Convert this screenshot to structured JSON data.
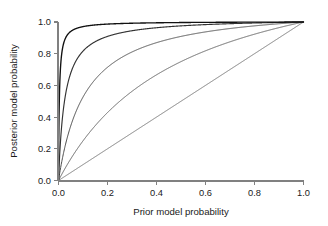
{
  "chart_data": {
    "type": "line",
    "title": "",
    "xlabel": "Prior model probability",
    "ylabel": "Posterior model probability",
    "xlim": [
      0.0,
      1.0
    ],
    "ylim": [
      0.0,
      1.0
    ],
    "grid": false,
    "legend": "none",
    "xticks": [
      "0.0",
      "0.2",
      "0.4",
      "0.6",
      "0.8",
      "1.0"
    ],
    "xtick_values": [
      0.0,
      0.2,
      0.4,
      0.6,
      0.8,
      1.0
    ],
    "yticks": [
      "0.0",
      "0.2",
      "0.4",
      "0.6",
      "0.8",
      "1.0"
    ],
    "ytick_values": [
      0.0,
      0.2,
      0.4,
      0.6,
      0.8,
      1.0
    ],
    "x": [
      0.0,
      0.01,
      0.02,
      0.03,
      0.05,
      0.075,
      0.1,
      0.15,
      0.2,
      0.25,
      0.3,
      0.35,
      0.4,
      0.5,
      0.6,
      0.7,
      0.8,
      0.9,
      0.95,
      1.0
    ],
    "series": [
      {
        "name": "Bayes factor 1",
        "label": "BF = 1",
        "bayes_factor": 1,
        "color": "#6b6b6b",
        "linewidth": 0.9,
        "values": [
          0.0,
          0.01,
          0.02,
          0.03,
          0.05,
          0.075,
          0.1,
          0.15,
          0.2,
          0.25,
          0.3,
          0.35,
          0.4,
          0.5,
          0.6,
          0.7,
          0.8,
          0.9,
          0.95,
          1.0
        ]
      },
      {
        "name": "Bayes factor 3",
        "label": "BF = 3",
        "bayes_factor": 3,
        "color": "#5a5a5a",
        "linewidth": 0.95,
        "values": [
          0.0,
          0.029,
          0.058,
          0.085,
          0.136,
          0.196,
          0.25,
          0.346,
          0.429,
          0.5,
          0.563,
          0.618,
          0.667,
          0.75,
          0.818,
          0.875,
          0.923,
          0.964,
          0.983,
          1.0
        ]
      },
      {
        "name": "Bayes factor 10",
        "label": "BF = 10",
        "bayes_factor": 10,
        "color": "#4a4a4a",
        "linewidth": 1.0,
        "values": [
          0.0,
          0.092,
          0.169,
          0.236,
          0.345,
          0.448,
          0.526,
          0.638,
          0.714,
          0.769,
          0.811,
          0.843,
          0.87,
          0.909,
          0.938,
          0.959,
          0.976,
          0.989,
          0.995,
          1.0
        ]
      },
      {
        "name": "Bayes factor 40",
        "label": "BF = 40",
        "bayes_factor": 40,
        "color": "#333333",
        "linewidth": 1.15,
        "values": [
          0.0,
          0.288,
          0.449,
          0.553,
          0.678,
          0.764,
          0.816,
          0.876,
          0.909,
          0.93,
          0.945,
          0.956,
          0.964,
          0.976,
          0.984,
          0.989,
          0.994,
          0.997,
          0.999,
          1.0
        ]
      },
      {
        "name": "Bayes factor 300",
        "label": "BF = 300",
        "bayes_factor": 300,
        "color": "#111111",
        "linewidth": 1.35,
        "values": [
          0.0,
          0.752,
          0.86,
          0.903,
          0.94,
          0.961,
          0.971,
          0.981,
          0.987,
          0.99,
          0.992,
          0.994,
          0.995,
          0.997,
          0.998,
          0.999,
          0.999,
          1.0,
          1.0,
          1.0
        ]
      }
    ]
  },
  "axes": {
    "x_title": "Prior model probability",
    "y_title": "Posterior model probability"
  }
}
